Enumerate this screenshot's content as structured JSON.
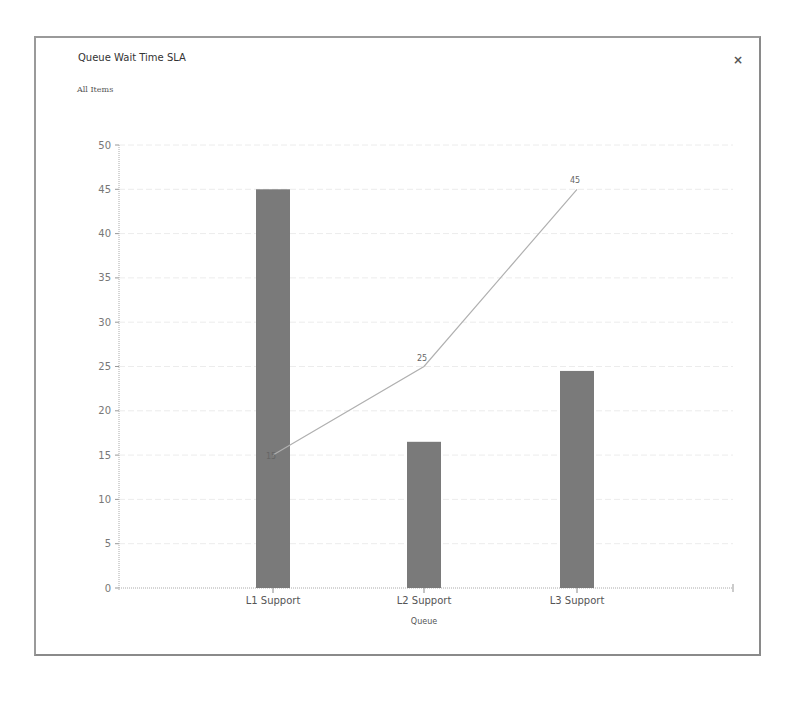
{
  "dialog": {
    "title": "Queue Wait Time SLA",
    "subtitle": "All Items",
    "close_label": "×"
  },
  "chart_data": {
    "type": "bar+line",
    "title": "Queue Wait Time SLA",
    "subtitle": "All Items",
    "xlabel": "Queue",
    "ylabel": "",
    "categories": [
      "L1 Support",
      "L2 Support",
      "L3 Support"
    ],
    "series": [
      {
        "name": "Bar",
        "type": "bar",
        "values": [
          45,
          16.5,
          24.5
        ],
        "color": "#7a7a7a"
      },
      {
        "name": "Line",
        "type": "line",
        "values": [
          15,
          25,
          45
        ],
        "labels": [
          "15",
          "25",
          "45"
        ],
        "color": "#b0b0b0"
      }
    ],
    "ylim": [
      0,
      50
    ],
    "yticks": [
      0,
      5,
      10,
      15,
      20,
      25,
      30,
      35,
      40,
      45,
      50
    ],
    "grid": true,
    "legend": "none"
  }
}
